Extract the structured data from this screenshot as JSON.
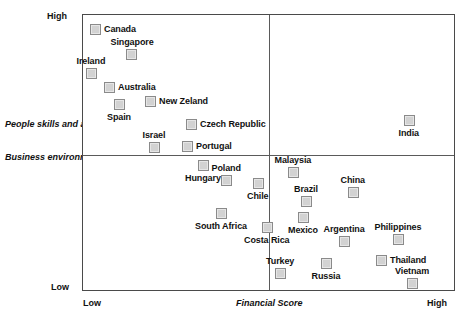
{
  "chart_data": {
    "type": "scatter",
    "title": "",
    "xlabel": "Financial Score",
    "ylabel_upper": "People skills and availability",
    "ylabel_lower": "Business environment",
    "x_tick_labels": [
      "Low",
      "High"
    ],
    "y_tick_labels": [
      "High",
      "Low"
    ],
    "xlim": [
      0,
      100
    ],
    "ylim": [
      0,
      100
    ],
    "grid": false,
    "legend": "none",
    "quadrant_divider_x": 50,
    "quadrant_divider_y": 50,
    "points": [
      {
        "label": "Canada",
        "x": 3.5,
        "y": 94.6,
        "mx": 89,
        "my": 23
      },
      {
        "label": "Singapore",
        "x": 13.1,
        "y": 85.6,
        "mx": 125,
        "my": 48
      },
      {
        "label": "Ireland",
        "x": 2.4,
        "y": 78.7,
        "mx": 85,
        "my": 67
      },
      {
        "label": "Australia",
        "x": 7.2,
        "y": 73.6,
        "mx": 103,
        "my": 81
      },
      {
        "label": "New Zeland",
        "x": 18.2,
        "y": 68.6,
        "mx": 144,
        "my": 95
      },
      {
        "label": "Spain",
        "x": 9.9,
        "y": 67.5,
        "mx": 113,
        "my": 98
      },
      {
        "label": "Czech Republic",
        "x": 29.2,
        "y": 60.3,
        "mx": 185,
        "my": 118
      },
      {
        "label": "Israel",
        "x": 19.3,
        "y": 52.0,
        "mx": 148,
        "my": 141
      },
      {
        "label": "Portugal",
        "x": 28.2,
        "y": 52.3,
        "mx": 181,
        "my": 140
      },
      {
        "label": "India",
        "x": 87.4,
        "y": 61.7,
        "mx": 403,
        "my": 114
      },
      {
        "label": "Malaysia",
        "x": 56.4,
        "y": 43.0,
        "mx": 287,
        "my": 166
      },
      {
        "label": "Hungary",
        "x": 32.4,
        "y": 45.5,
        "mx": 197,
        "my": 159
      },
      {
        "label": "Poland",
        "x": 38.6,
        "y": 40.1,
        "mx": 220,
        "my": 174
      },
      {
        "label": "Chile",
        "x": 47.2,
        "y": 39.0,
        "mx": 252,
        "my": 177
      },
      {
        "label": "China",
        "x": 72.6,
        "y": 35.7,
        "mx": 347,
        "my": 186
      },
      {
        "label": "Brazil",
        "x": 59.8,
        "y": 32.5,
        "mx": 300,
        "my": 195
      },
      {
        "label": "South Africa",
        "x": 36.9,
        "y": 28.2,
        "mx": 215,
        "my": 207
      },
      {
        "label": "Mexico",
        "x": 59.0,
        "y": 26.7,
        "mx": 297,
        "my": 211
      },
      {
        "label": "Costa Rica",
        "x": 49.5,
        "y": 23.1,
        "mx": 261,
        "my": 221
      },
      {
        "label": "Argentina",
        "x": 70.1,
        "y": 18.1,
        "mx": 338,
        "my": 235
      },
      {
        "label": "Philippines",
        "x": 84.7,
        "y": 18.8,
        "mx": 392,
        "my": 233
      },
      {
        "label": "Thailand",
        "x": 80.2,
        "y": 11.2,
        "mx": 375,
        "my": 254
      },
      {
        "label": "Russia",
        "x": 65.5,
        "y": 10.1,
        "mx": 320,
        "my": 257
      },
      {
        "label": "Turkey",
        "x": 53.1,
        "y": 6.5,
        "mx": 274,
        "my": 267
      },
      {
        "label": "Vietnam",
        "x": 88.2,
        "y": 2.9,
        "mx": 406,
        "my": 277
      }
    ]
  }
}
